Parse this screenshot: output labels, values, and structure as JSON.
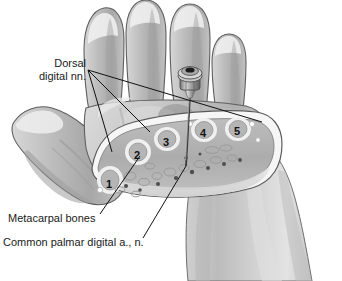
{
  "figure": {
    "background_color": "#ffffff",
    "width": 342,
    "height": 281
  },
  "labels": {
    "dorsal_digital": {
      "line1": "Dorsal",
      "line2": "digital nn."
    },
    "metacarpal_bones": "Metacarpal bones",
    "common_palmar": "Common palmar digital a., n."
  },
  "cross_section": {
    "caption_note": "Numbered metacarpal bones in cut face",
    "numbers": [
      {
        "label": "1",
        "x": 106,
        "y": 178
      },
      {
        "label": "2",
        "x": 134,
        "y": 149
      },
      {
        "label": "3",
        "x": 163,
        "y": 136
      },
      {
        "label": "4",
        "x": 200,
        "y": 127
      },
      {
        "label": "5",
        "x": 234,
        "y": 125
      }
    ]
  },
  "instrument": {
    "name": "needle-and-hub",
    "hub_center_x": 190,
    "hub_center_y": 74,
    "needle_tip_x": 186,
    "needle_tip_y": 166
  },
  "colors": {
    "skin_light": "#e2e2e2",
    "skin_mid": "#c9c9c9",
    "skin_dark": "#a9a9a9",
    "skin_shadow": "#8f8f8f",
    "cut_face": "#b4b4b4",
    "bone_fill": "#c0c0c0",
    "bone_rim": "#f2f2f2",
    "outline": "#4a4a4a",
    "leader_line": "#111111",
    "metal": "#9a9a9a",
    "metal_dark": "#5e5e5e"
  },
  "icons": {
    "needle": "needle-icon",
    "hub": "syringe-hub-icon"
  }
}
